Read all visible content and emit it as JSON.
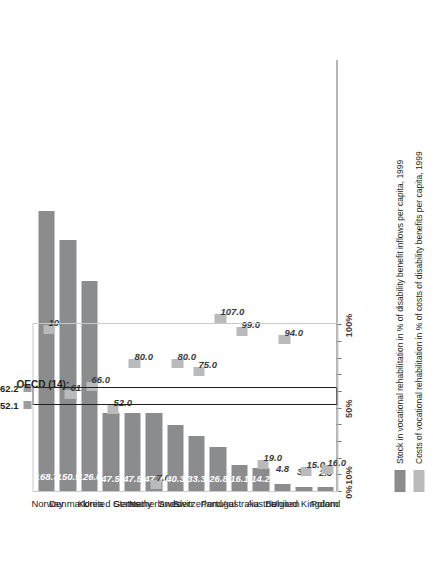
{
  "chart_data": {
    "type": "bar",
    "title": "",
    "xlabel": "",
    "ylabel": "",
    "orientation": "vertical-rotated",
    "ylim": [
      0,
      180
    ],
    "axis_ticks": [
      {
        "value": 0,
        "label": "0%"
      },
      {
        "value": 10,
        "label": "10%"
      },
      {
        "value": 20,
        "label": ""
      },
      {
        "value": 30,
        "label": ""
      },
      {
        "value": 40,
        "label": ""
      },
      {
        "value": 50,
        "label": "50%"
      },
      {
        "value": 60,
        "label": ""
      },
      {
        "value": 70,
        "label": ""
      },
      {
        "value": 80,
        "label": ""
      },
      {
        "value": 90,
        "label": ""
      },
      {
        "value": 100,
        "label": "100%"
      }
    ],
    "categories": [
      "Norway",
      "Denmark",
      "Korea",
      "United States",
      "Germany",
      "Netherlands",
      "Sweden",
      "Switzerland",
      "Portugal",
      "Australia",
      "Austria",
      "Belgium",
      "United Kingdom",
      "Poland"
    ],
    "series": [
      {
        "name": "Stock in vocational rehabilitation in % of disability benefit inflows per capita, 1999",
        "color": "#8a8c8e",
        "values": [
          168.7,
          150.9,
          126.6,
          47.5,
          47.5,
          47.4,
          40.3,
          33.3,
          26.8,
          16.1,
          14.2,
          4.8,
          3.1,
          2.8
        ],
        "labels": [
          "168.7",
          "150.9",
          "126.6",
          "47.5",
          "47.5",
          "47.4",
          "40.3",
          "33.3",
          "26.8",
          "16.1",
          "14.2",
          "4.8",
          "3.1",
          "2.8"
        ]
      },
      {
        "name": "Costs of vocational rehabilitation in % of costs of disability benefits per capita, 1999",
        "color": "#b8babc",
        "values": [
          100.0,
          61.0,
          66.0,
          52.0,
          80.0,
          7.0,
          80.0,
          75.0,
          107.0,
          99.0,
          19.0,
          94.0,
          15.0,
          16.0
        ],
        "labels": [
          "100.0",
          "61.0",
          "66.0",
          "52.0",
          "80.0",
          "7.0",
          "80.0",
          "75.0",
          "107.0",
          "99.0",
          "19.0",
          "94.0",
          "15.0",
          "16.0"
        ]
      }
    ],
    "reference": {
      "title": "OECD (14):",
      "values": [
        52.1,
        62.2
      ],
      "labels": [
        "52.1",
        "62.2"
      ]
    },
    "legend": {
      "position": "bottom-left",
      "entries": [
        "Stock in vocational rehabilitation in % of disability benefit inflows per capita, 1999",
        "Costs of vocational rehabilitation in % of costs of disability benefits per capita, 1999"
      ]
    },
    "colors": {
      "bar": "#8a8c8e",
      "marker": "#b8babc",
      "axis": "#6d6e71",
      "text": "#231f20"
    }
  }
}
